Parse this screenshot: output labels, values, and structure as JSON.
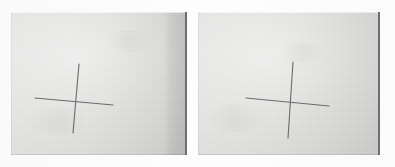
{
  "scene": {
    "title": "Cross mark photo pair",
    "description": "Two side-by-side photographs of a hand-drawn pencil cross on light gray paper",
    "width": 395,
    "height": 167,
    "background_color": "#fdfdfd",
    "paper_color": "#d8d8d6",
    "pencil_color": "#6b6b6b",
    "edge_line_color": "#6f6f6f"
  },
  "panels": [
    {
      "id": "left-photo",
      "label": "Left photograph",
      "frame": {
        "x": 11,
        "y": 12,
        "width": 176,
        "height": 143
      },
      "has_shadow_band": true,
      "shadow_band": {
        "x": 152,
        "width": 35
      },
      "right_edge_line": true,
      "cross": {
        "label": "pencil cross mark",
        "vertical": {
          "x1": 79,
          "y1": 64,
          "x2": 73,
          "y2": 133,
          "width": 1.1
        },
        "horizontal": {
          "x1": 35,
          "y1": 98,
          "x2": 113,
          "y2": 105,
          "width": 1.1
        },
        "intersection": {
          "x": 76,
          "y": 101
        }
      }
    },
    {
      "id": "right-photo",
      "label": "Right photograph",
      "frame": {
        "x": 198,
        "y": 12,
        "width": 182,
        "height": 143
      },
      "has_shadow_band": false,
      "right_edge_line": true,
      "cross": {
        "label": "pencil cross mark",
        "vertical": {
          "x1": 293,
          "y1": 62,
          "x2": 288,
          "y2": 138,
          "width": 1.1
        },
        "horizontal": {
          "x1": 246,
          "y1": 98,
          "x2": 329,
          "y2": 106,
          "width": 1.1
        },
        "intersection": {
          "x": 291,
          "y": 101
        }
      }
    }
  ]
}
